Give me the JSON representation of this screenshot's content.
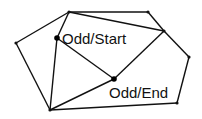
{
  "diagram": {
    "type": "graph",
    "title": "",
    "vertices": [
      {
        "id": "top",
        "x": 69,
        "y": 12,
        "size": "small",
        "label": ""
      },
      {
        "id": "top_right",
        "x": 148,
        "y": 12,
        "size": "small",
        "label": ""
      },
      {
        "id": "mid_right",
        "x": 164,
        "y": 31,
        "size": "small",
        "label": ""
      },
      {
        "id": "right",
        "x": 189,
        "y": 57,
        "size": "small",
        "label": ""
      },
      {
        "id": "bottom_right",
        "x": 177,
        "y": 103,
        "size": "small",
        "label": ""
      },
      {
        "id": "bottom_left",
        "x": 50,
        "y": 110,
        "size": "small",
        "label": ""
      },
      {
        "id": "left",
        "x": 16,
        "y": 43,
        "size": "small",
        "label": ""
      },
      {
        "id": "odd_start",
        "x": 57,
        "y": 38,
        "size": "big",
        "label": "Odd/Start"
      },
      {
        "id": "odd_end",
        "x": 114,
        "y": 79,
        "size": "big",
        "label": "Odd/End"
      }
    ],
    "edges": [
      [
        "top",
        "top_right"
      ],
      [
        "top",
        "mid_right"
      ],
      [
        "top",
        "left"
      ],
      [
        "top",
        "odd_start"
      ],
      [
        "top_right",
        "mid_right"
      ],
      [
        "mid_right",
        "right"
      ],
      [
        "mid_right",
        "odd_end"
      ],
      [
        "right",
        "bottom_right"
      ],
      [
        "bottom_right",
        "bottom_left"
      ],
      [
        "bottom_left",
        "left"
      ],
      [
        "bottom_left",
        "odd_start"
      ],
      [
        "bottom_left",
        "odd_end"
      ],
      [
        "odd_start",
        "odd_end"
      ]
    ],
    "labels": {
      "odd_start": {
        "text": "Odd/Start",
        "x": 62,
        "y": 44
      },
      "odd_end": {
        "text": "Odd/End",
        "x": 109,
        "y": 98
      }
    },
    "colors": {
      "edge": "#111111",
      "vertex": "#111111",
      "background": "#ffffff"
    }
  }
}
